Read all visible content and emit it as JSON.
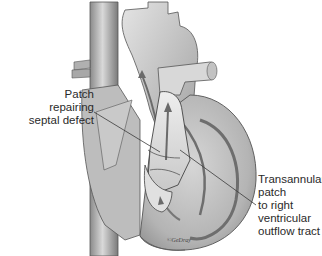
{
  "figure": {
    "labels": {
      "left": {
        "lines": [
          "Patch",
          "repairing",
          "septal defect"
        ]
      },
      "right": {
        "lines": [
          "Transannular",
          "patch",
          "to right",
          "ventricular",
          "outflow tract"
        ]
      }
    },
    "signature": "©GeDray",
    "colors": {
      "background": "#ffffff",
      "tissue_light": "#d8d8d8",
      "tissue_mid": "#a9a9a9",
      "tissue_dark": "#6e6e6e",
      "text": "#2a2a2a",
      "leader_line": "#3a3a3a"
    }
  }
}
